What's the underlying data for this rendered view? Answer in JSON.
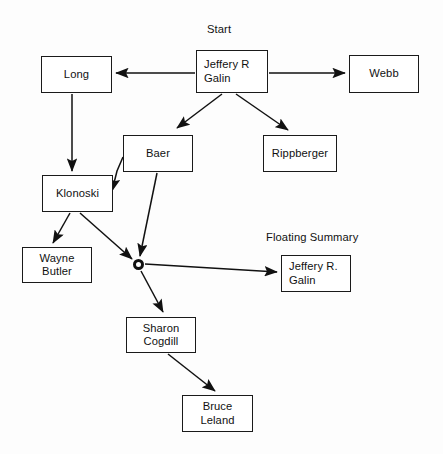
{
  "canvas": {
    "width": 443,
    "height": 454,
    "background": "#fdfdfd",
    "stroke_color": "#111111",
    "text_color": "#111111"
  },
  "labels": {
    "start": "Start",
    "floating_summary": "Floating Summary"
  },
  "nodes": {
    "long": {
      "line1": "Long"
    },
    "jeffery_r_galin": {
      "line1": "Jeffery R",
      "line2": "Galin"
    },
    "webb": {
      "line1": "Webb"
    },
    "baer": {
      "line1": "Baer"
    },
    "rippberger": {
      "line1": "Rippberger"
    },
    "klonoski": {
      "line1": "Klonoski"
    },
    "wayne_butler": {
      "line1": "Wayne",
      "line2": "Butler"
    },
    "summary_jeffery_r_galin": {
      "line1": "Jeffery R.",
      "line2": "Galin"
    },
    "sharon_cogdill": {
      "line1": "Sharon",
      "line2": "Cogdill"
    },
    "bruce_leland": {
      "line1": "Bruce",
      "line2": "Leland"
    }
  },
  "graph": {
    "type": "directed-node-link-diagram",
    "node_list": [
      {
        "id": "jeffery_r_galin",
        "label": "Jeffery R Galin",
        "x": 196,
        "y": 50,
        "w": 72,
        "h": 43
      },
      {
        "id": "long",
        "label": "Long",
        "x": 41,
        "y": 56,
        "w": 71,
        "h": 37
      },
      {
        "id": "webb",
        "label": "Webb",
        "x": 349,
        "y": 55,
        "w": 70,
        "h": 38
      },
      {
        "id": "baer",
        "label": "Baer",
        "x": 123,
        "y": 135,
        "w": 70,
        "h": 37
      },
      {
        "id": "rippberger",
        "label": "Rippberger",
        "x": 263,
        "y": 135,
        "w": 74,
        "h": 37
      },
      {
        "id": "klonoski",
        "label": "Klonoski",
        "x": 42,
        "y": 175,
        "w": 71,
        "h": 37
      },
      {
        "id": "wayne_butler",
        "label": "Wayne Butler",
        "x": 22,
        "y": 247,
        "w": 70,
        "h": 36
      },
      {
        "id": "junction",
        "label": "",
        "x": 133,
        "y": 259,
        "w": 11,
        "h": 11
      },
      {
        "id": "summary_jeffery_r_galin",
        "label": "Jeffery R. Galin",
        "x": 281,
        "y": 255,
        "w": 70,
        "h": 37
      },
      {
        "id": "sharon_cogdill",
        "label": "Sharon Cogdill",
        "x": 126,
        "y": 317,
        "w": 70,
        "h": 36
      },
      {
        "id": "bruce_leland",
        "label": "Bruce Leland",
        "x": 182,
        "y": 395,
        "w": 71,
        "h": 37
      }
    ],
    "edge_list": [
      {
        "from": "jeffery_r_galin",
        "to": "long"
      },
      {
        "from": "jeffery_r_galin",
        "to": "webb"
      },
      {
        "from": "jeffery_r_galin",
        "to": "baer"
      },
      {
        "from": "jeffery_r_galin",
        "to": "rippberger"
      },
      {
        "from": "long",
        "to": "klonoski"
      },
      {
        "from": "baer",
        "to": "klonoski"
      },
      {
        "from": "baer",
        "to": "junction"
      },
      {
        "from": "klonoski",
        "to": "wayne_butler"
      },
      {
        "from": "klonoski",
        "to": "junction"
      },
      {
        "from": "junction",
        "to": "summary_jeffery_r_galin"
      },
      {
        "from": "junction",
        "to": "sharon_cogdill"
      },
      {
        "from": "sharon_cogdill",
        "to": "bruce_leland"
      }
    ]
  }
}
